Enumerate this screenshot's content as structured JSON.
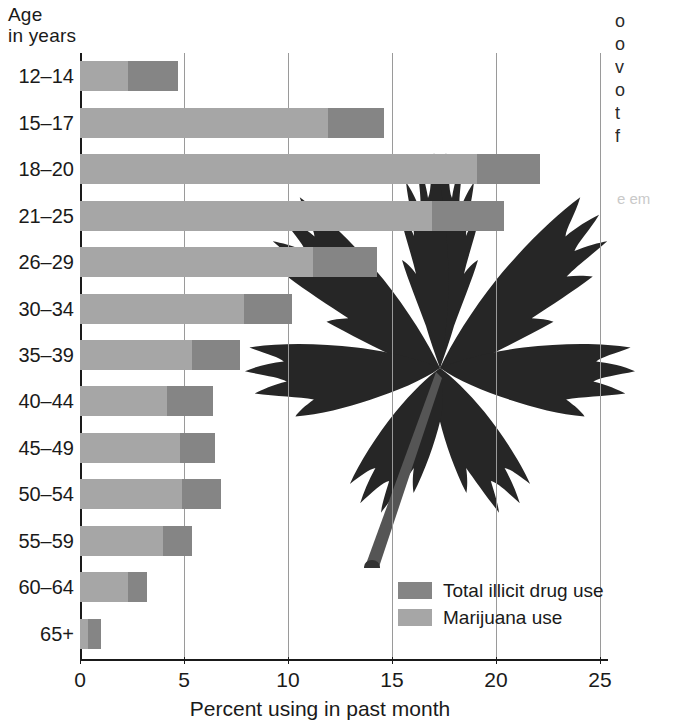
{
  "chart_data": {
    "type": "bar",
    "orientation": "horizontal",
    "stacked": false,
    "title": "",
    "axis_title": "Age\nin years",
    "xlabel": "Percent using in past month",
    "ylabel": "Age in years",
    "xlim": [
      0,
      25
    ],
    "xticks": [
      0,
      5,
      10,
      15,
      20,
      25
    ],
    "xtick_labels": [
      "0",
      "5",
      "10",
      "15",
      "20",
      "25"
    ],
    "grid": true,
    "grid_axis": "x",
    "legend_position": "inside-bottom-right",
    "categories": [
      "12–14",
      "15–17",
      "18–20",
      "21–25",
      "26–29",
      "30–34",
      "35–39",
      "40–44",
      "45–49",
      "50–54",
      "55–59",
      "60–64",
      "65+"
    ],
    "series": [
      {
        "name": "Total illicit drug use",
        "color": "#858585",
        "values": [
          4.7,
          14.6,
          22.1,
          20.4,
          14.3,
          10.2,
          7.7,
          6.4,
          6.5,
          6.8,
          5.4,
          3.2,
          1.0
        ]
      },
      {
        "name": "Marijuana use",
        "color": "#a6a6a6",
        "values": [
          2.3,
          11.9,
          19.1,
          16.9,
          11.2,
          7.9,
          5.4,
          4.2,
          4.8,
          4.9,
          4.0,
          2.3,
          0.4
        ]
      }
    ]
  },
  "legend": {
    "items": [
      {
        "label": "Total illicit drug use",
        "swatch": "total"
      },
      {
        "label": "Marijuana use",
        "swatch": "mj"
      }
    ]
  },
  "margin_text": {
    "bleed_right": "o\no\nv\no\nt\nf",
    "bleed_faint": "e em"
  },
  "colors": {
    "total_illicit": "#858585",
    "marijuana": "#a6a6a6",
    "axis": "#1a1a1a",
    "grid": "#9a9a9a",
    "background": "#ffffff"
  }
}
